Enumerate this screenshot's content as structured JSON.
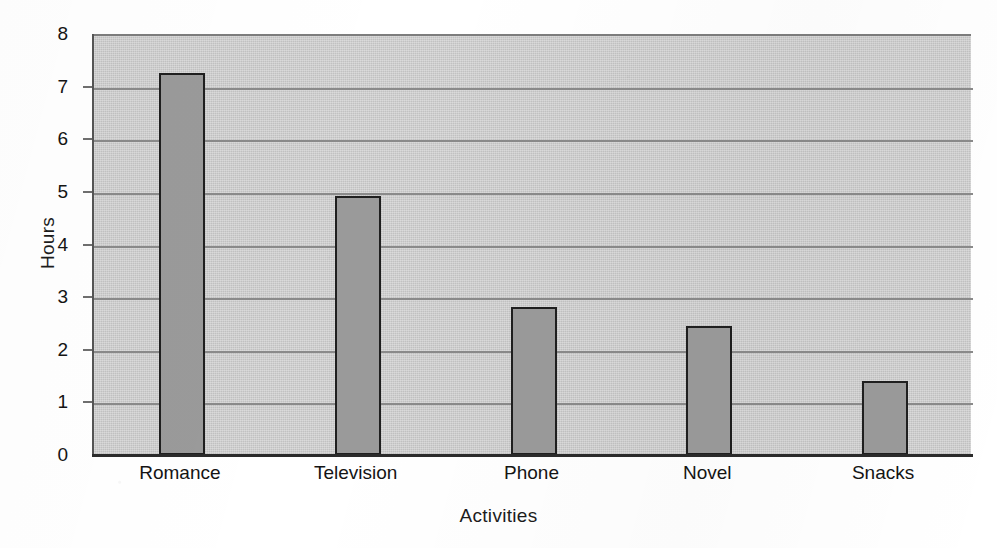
{
  "chart_data": {
    "type": "bar",
    "title": "",
    "xlabel": "Activities",
    "ylabel": "Hours",
    "categories": [
      "Romance",
      "Television",
      "Phone",
      "Novel",
      "Snacks"
    ],
    "values": [
      7.25,
      4.93,
      2.82,
      2.46,
      1.4
    ],
    "ylim": [
      0,
      8
    ],
    "ytick_labels": [
      "8",
      "7",
      "6",
      "5",
      "4",
      "3",
      "2",
      "1",
      "0"
    ],
    "ytick_values": [
      8,
      7,
      6,
      5,
      4,
      3,
      2,
      1,
      0
    ],
    "grid": true,
    "legend": "none",
    "series": [
      {
        "name": "Hours",
        "values": [
          7.25,
          4.93,
          2.82,
          2.46,
          1.4
        ]
      }
    ],
    "colors": {
      "bar_fill": "#9a9a9a",
      "bar_outline": "#1f1f1f",
      "plot_background": "#c9c9c9",
      "gridline": "#8a8a8a",
      "axis": "#2b2b2b",
      "text": "#141414",
      "page_background": "#ffffff"
    }
  },
  "axes": {
    "y_title": "Hours",
    "x_title": "Activities"
  }
}
